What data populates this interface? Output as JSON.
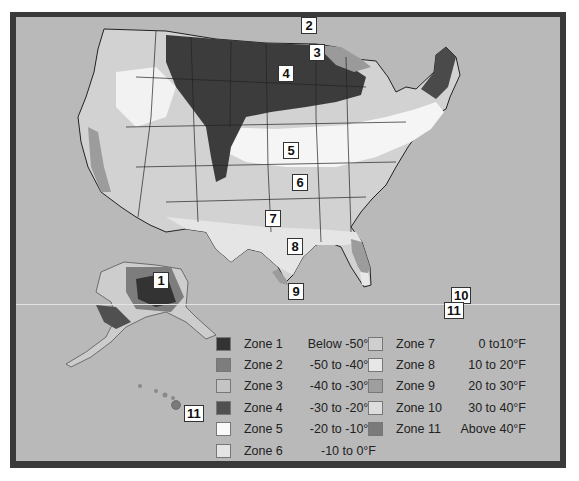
{
  "map": {
    "title": "USDA Plant Hardiness Zone Map",
    "colors": {
      "background": "#b9b9b9",
      "frame": "#3a3a3a",
      "state_border": "#222222"
    },
    "zone_labels": [
      {
        "zone": "1",
        "x": 153,
        "y": 272
      },
      {
        "zone": "2",
        "x": 300,
        "y": 17
      },
      {
        "zone": "3",
        "x": 308,
        "y": 44
      },
      {
        "zone": "4",
        "x": 278,
        "y": 65
      },
      {
        "zone": "5",
        "x": 283,
        "y": 142
      },
      {
        "zone": "6",
        "x": 292,
        "y": 174
      },
      {
        "zone": "7",
        "x": 265,
        "y": 210
      },
      {
        "zone": "8",
        "x": 290,
        "y": 238
      },
      {
        "zone": "9",
        "x": 287,
        "y": 283
      },
      {
        "zone": "10",
        "x": 450,
        "y": 287
      },
      {
        "zone": "11",
        "x": 445,
        "y": 300
      },
      {
        "zone": "11",
        "x": 183,
        "y": 405
      }
    ]
  },
  "legend": {
    "left": [
      {
        "swatch": "#333333",
        "name": "Zone  1",
        "range": "Below -50°F"
      },
      {
        "swatch": "#7d7d7d",
        "name": "Zone  2",
        "range": "-50 to -40°F"
      },
      {
        "swatch": "#c4c4c4",
        "name": "Zone  3",
        "range": "-40 to -30°F"
      },
      {
        "swatch": "#505050",
        "name": "Zone  4",
        "range": "-30 to -20°F"
      },
      {
        "swatch": "#fafafa",
        "name": "Zone  5",
        "range": "-20 to -10°F"
      },
      {
        "swatch": "#e4e4e4",
        "name": "Zone  6",
        "range": "-10 to 0°F"
      }
    ],
    "right": [
      {
        "swatch": "#cfcfcf",
        "name": "Zone  7",
        "range": "0 to10°F"
      },
      {
        "swatch": "#e7e7e7",
        "name": "Zone  8",
        "range": "10 to 20°F"
      },
      {
        "swatch": "#9e9e9e",
        "name": "Zone  9",
        "range": "20 to 30°F"
      },
      {
        "swatch": "#dddddd",
        "name": "Zone 10",
        "range": "30 to 40°F"
      },
      {
        "swatch": "#7a7a7a",
        "name": "Zone 11",
        "range": "Above 40°F"
      }
    ]
  }
}
